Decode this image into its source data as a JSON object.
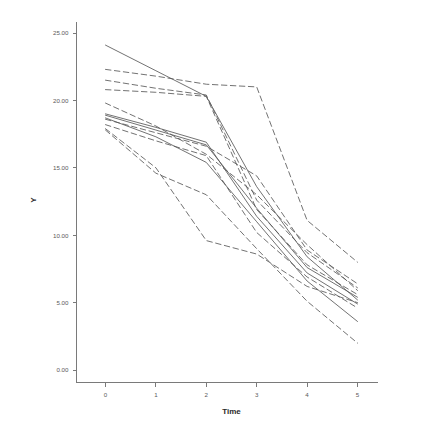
{
  "chart_data": {
    "type": "line",
    "title": "",
    "subtitle": "",
    "xlabel": "Time",
    "ylabel": "Y",
    "x": [
      0,
      1,
      2,
      3,
      4,
      5
    ],
    "xticklabels": [
      "0",
      "1",
      "2",
      "3",
      "4",
      "5"
    ],
    "yticklabels": [
      "0.00",
      "5.00",
      "10.00",
      "15.00",
      "20.00",
      "25.00"
    ],
    "yticks": [
      0,
      5,
      10,
      15,
      20,
      25
    ],
    "xlim": [
      -0.35,
      5.35
    ],
    "ylim": [
      -1.2,
      26.6
    ],
    "grid": false,
    "legend": false,
    "legend_position": "none",
    "line_color": "#585858",
    "background_color": "#ffffff",
    "axis_color": "#7a7a7a",
    "series": [
      {
        "name": "subject-1",
        "style": "solid",
        "values": [
          24.1,
          22.2,
          20.3,
          13.6,
          8.4,
          5.2
        ]
      },
      {
        "name": "subject-2",
        "style": "dashed",
        "values": [
          22.3,
          21.8,
          21.2,
          21.0,
          11.1,
          8.0
        ]
      },
      {
        "name": "subject-3",
        "style": "dashed",
        "values": [
          21.5,
          20.9,
          20.4,
          12.6,
          8.7,
          6.1
        ]
      },
      {
        "name": "subject-4",
        "style": "dashed",
        "values": [
          20.8,
          20.6,
          20.3,
          11.9,
          7.8,
          5.6
        ]
      },
      {
        "name": "subject-5",
        "style": "dashed",
        "values": [
          19.8,
          18.1,
          16.0,
          13.0,
          9.3,
          5.9
        ]
      },
      {
        "name": "subject-6",
        "style": "solid",
        "values": [
          19.0,
          18.0,
          16.9,
          11.4,
          7.2,
          4.9
        ]
      },
      {
        "name": "subject-7",
        "style": "solid",
        "values": [
          18.9,
          17.8,
          16.7,
          12.0,
          7.6,
          5.4
        ]
      },
      {
        "name": "subject-8",
        "style": "solid",
        "values": [
          18.7,
          17.3,
          15.4,
          11.0,
          6.6,
          3.6
        ]
      },
      {
        "name": "subject-9",
        "style": "dashed",
        "values": [
          18.6,
          17.6,
          16.6,
          14.4,
          8.9,
          6.4
        ]
      },
      {
        "name": "subject-10",
        "style": "dashed",
        "values": [
          18.2,
          17.0,
          15.9,
          10.2,
          6.9,
          4.6
        ]
      },
      {
        "name": "subject-11",
        "style": "dashed",
        "values": [
          17.9,
          15.0,
          9.6,
          8.6,
          6.2,
          5.0
        ]
      },
      {
        "name": "subject-12",
        "style": "dashed",
        "values": [
          17.8,
          14.6,
          13.0,
          9.0,
          5.1,
          2.0
        ]
      }
    ]
  },
  "axes": {
    "y_title": "Y",
    "x_title": "Time"
  }
}
